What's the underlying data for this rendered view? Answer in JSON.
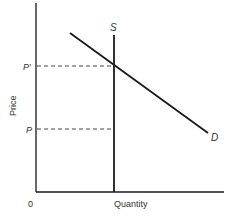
{
  "diagram": {
    "type": "supply-demand",
    "axes": {
      "x_label": "Quantity",
      "y_label": "Price",
      "origin_label": "0"
    },
    "curves": {
      "supply_label": "S",
      "demand_label": "D"
    },
    "price_levels": {
      "p_prime_label": "P′",
      "p_label": "P"
    },
    "colors": {
      "line": "#1a1a1a",
      "text": "#333333",
      "background": "#ffffff"
    }
  }
}
